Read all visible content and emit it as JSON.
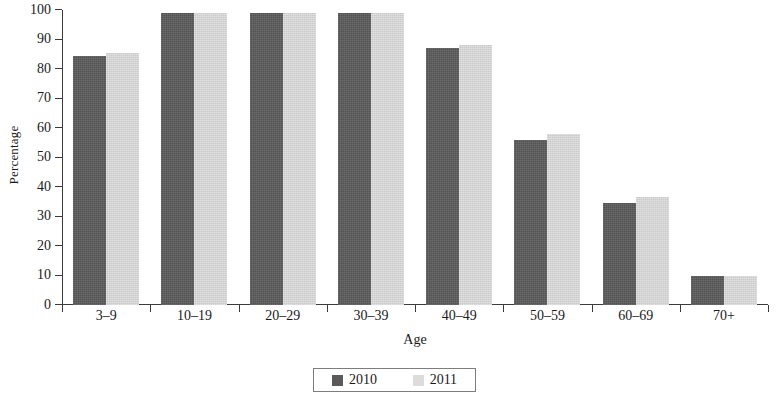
{
  "chart_data": {
    "type": "bar",
    "title": "",
    "xlabel": "Age",
    "ylabel": "Percentage",
    "ylim": [
      0,
      100
    ],
    "yticks": [
      0,
      10,
      20,
      30,
      40,
      50,
      60,
      70,
      80,
      90,
      100
    ],
    "grid": false,
    "legend_position": "bottom",
    "categories": [
      "3–9",
      "10–19",
      "20–29",
      "30–39",
      "40–49",
      "50–59",
      "60–69",
      "70+"
    ],
    "series": [
      {
        "name": "2010",
        "color": "#5a5a5b",
        "values": [
          84.5,
          99,
          99,
          99,
          87,
          56,
          34.5,
          9.8
        ]
      },
      {
        "name": "2011",
        "color": "#dcdcdc",
        "values": [
          85.5,
          99,
          99,
          99,
          88,
          58,
          36.5,
          10
        ]
      }
    ]
  },
  "legend": {
    "items": [
      {
        "label": "2010"
      },
      {
        "label": "2011"
      }
    ]
  }
}
